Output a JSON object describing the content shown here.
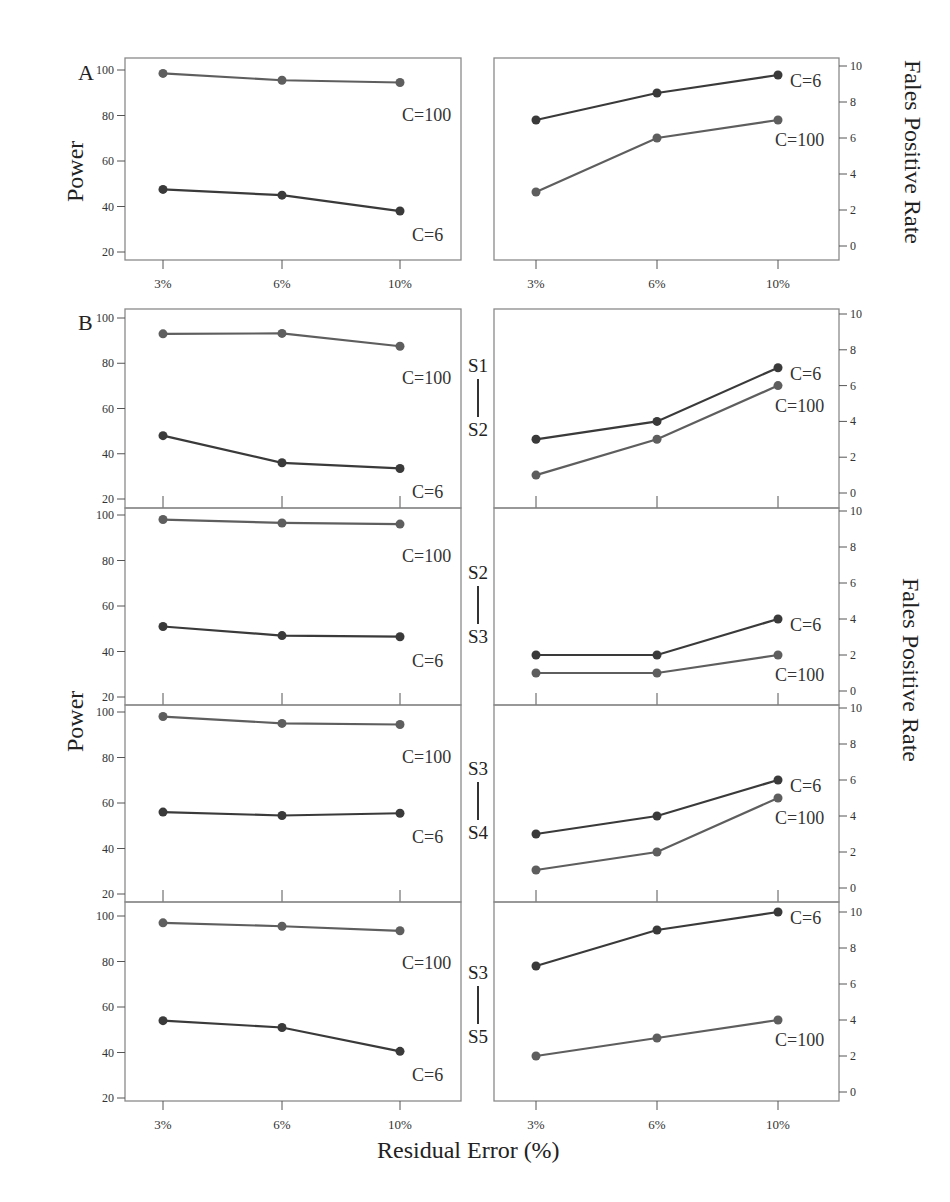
{
  "figure": {
    "panel_letters": {
      "a": "A",
      "b": "B"
    },
    "x_axis_title": "Residual Error (%)",
    "left_axis_title": "Power",
    "right_axis_title": "Fales Positive Rate",
    "pair_labels": [
      {
        "top": "S1",
        "bottom": "S2"
      },
      {
        "top": "S2",
        "bottom": "S3"
      },
      {
        "top": "S3",
        "bottom": "S4"
      },
      {
        "top": "S3",
        "bottom": "S5"
      }
    ],
    "colors": {
      "c6": "#3a3a3a",
      "c100": "#5e5e5e",
      "frame": "#8a8a8a",
      "text": "#222222"
    }
  },
  "chart_data": [
    {
      "id": "A-power",
      "panel": "A",
      "type": "line",
      "title": "",
      "xlabel": "Residual Error (%)",
      "ylabel": "Power",
      "categories": [
        "3%",
        "6%",
        "10%"
      ],
      "ylim": [
        20,
        100
      ],
      "yticks": [
        20,
        40,
        60,
        80,
        100
      ],
      "grid": false,
      "series": [
        {
          "name": "C=100",
          "values": [
            98.5,
            95.5,
            94.5
          ]
        },
        {
          "name": "C=6",
          "values": [
            47.5,
            45,
            38
          ]
        }
      ]
    },
    {
      "id": "A-fpr",
      "panel": "A",
      "type": "line",
      "title": "",
      "xlabel": "Residual Error (%)",
      "ylabel": "Fales Positive Rate",
      "categories": [
        "3%",
        "6%",
        "10%"
      ],
      "ylim": [
        0,
        10
      ],
      "yticks": [
        0,
        2,
        4,
        6,
        8,
        10
      ],
      "grid": false,
      "series": [
        {
          "name": "C=6",
          "values": [
            7,
            8.5,
            9.5
          ]
        },
        {
          "name": "C=100",
          "values": [
            3,
            6,
            7
          ]
        }
      ]
    },
    {
      "id": "B-S1-S2-power",
      "panel": "B",
      "comparison": "S1-S2",
      "type": "line",
      "ylabel": "Power",
      "categories": [
        "3%",
        "6%",
        "10%"
      ],
      "ylim": [
        20,
        100
      ],
      "yticks": [
        20,
        40,
        60,
        80,
        100
      ],
      "series": [
        {
          "name": "C=100",
          "values": [
            93,
            93.2,
            87.5
          ]
        },
        {
          "name": "C=6",
          "values": [
            48,
            36,
            33.5
          ]
        }
      ]
    },
    {
      "id": "B-S1-S2-fpr",
      "panel": "B",
      "comparison": "S1-S2",
      "type": "line",
      "ylabel": "Fales Positive Rate",
      "categories": [
        "3%",
        "6%",
        "10%"
      ],
      "ylim": [
        0,
        10
      ],
      "yticks": [
        0,
        2,
        4,
        6,
        8,
        10
      ],
      "series": [
        {
          "name": "C=6",
          "values": [
            3,
            4,
            7
          ]
        },
        {
          "name": "C=100",
          "values": [
            1,
            3,
            6
          ]
        }
      ]
    },
    {
      "id": "B-S2-S3-power",
      "panel": "B",
      "comparison": "S2-S3",
      "type": "line",
      "ylabel": "Power",
      "categories": [
        "3%",
        "6%",
        "10%"
      ],
      "ylim": [
        20,
        100
      ],
      "yticks": [
        20,
        40,
        60,
        80,
        100
      ],
      "series": [
        {
          "name": "C=100",
          "values": [
            98,
            96.5,
            96
          ]
        },
        {
          "name": "C=6",
          "values": [
            51,
            47,
            46.5
          ]
        }
      ]
    },
    {
      "id": "B-S2-S3-fpr",
      "panel": "B",
      "comparison": "S2-S3",
      "type": "line",
      "ylabel": "Fales Positive Rate",
      "categories": [
        "3%",
        "6%",
        "10%"
      ],
      "ylim": [
        0,
        10
      ],
      "yticks": [
        0,
        2,
        4,
        6,
        8,
        10
      ],
      "series": [
        {
          "name": "C=6",
          "values": [
            2,
            2,
            4
          ]
        },
        {
          "name": "C=100",
          "values": [
            1,
            1,
            2
          ]
        }
      ]
    },
    {
      "id": "B-S3-S4-power",
      "panel": "B",
      "comparison": "S3-S4",
      "type": "line",
      "ylabel": "Power",
      "categories": [
        "3%",
        "6%",
        "10%"
      ],
      "ylim": [
        20,
        100
      ],
      "yticks": [
        20,
        40,
        60,
        80,
        100
      ],
      "series": [
        {
          "name": "C=100",
          "values": [
            98,
            95,
            94.5
          ]
        },
        {
          "name": "C=6",
          "values": [
            56,
            54.5,
            55.5
          ]
        }
      ]
    },
    {
      "id": "B-S3-S4-fpr",
      "panel": "B",
      "comparison": "S3-S4",
      "type": "line",
      "ylabel": "Fales Positive Rate",
      "categories": [
        "3%",
        "6%",
        "10%"
      ],
      "ylim": [
        0,
        10
      ],
      "yticks": [
        0,
        2,
        4,
        6,
        8,
        10
      ],
      "series": [
        {
          "name": "C=6",
          "values": [
            3,
            4,
            6
          ]
        },
        {
          "name": "C=100",
          "values": [
            1,
            2,
            5
          ]
        }
      ]
    },
    {
      "id": "B-S3-S5-power",
      "panel": "B",
      "comparison": "S3-S5",
      "type": "line",
      "ylabel": "Power",
      "categories": [
        "3%",
        "6%",
        "10%"
      ],
      "ylim": [
        20,
        100
      ],
      "yticks": [
        20,
        40,
        60,
        80,
        100
      ],
      "series": [
        {
          "name": "C=100",
          "values": [
            97,
            95.5,
            93.5
          ]
        },
        {
          "name": "C=6",
          "values": [
            54,
            51,
            40.5
          ]
        }
      ]
    },
    {
      "id": "B-S3-S5-fpr",
      "panel": "B",
      "comparison": "S3-S5",
      "type": "line",
      "ylabel": "Fales Positive Rate",
      "categories": [
        "3%",
        "6%",
        "10%"
      ],
      "ylim": [
        0,
        10
      ],
      "yticks": [
        0,
        2,
        4,
        6,
        8,
        10
      ],
      "series": [
        {
          "name": "C=6",
          "values": [
            7,
            9,
            10
          ]
        },
        {
          "name": "C=100",
          "values": [
            2,
            3,
            4
          ]
        }
      ]
    }
  ]
}
